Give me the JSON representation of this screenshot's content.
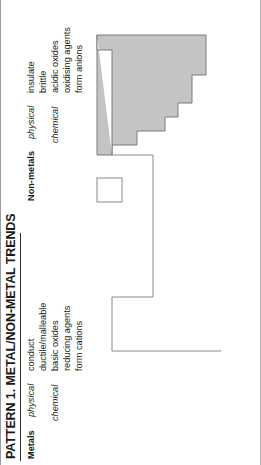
{
  "page": {
    "title": "PATTERN 1. METAL/NON-METAL TRENDS"
  },
  "legend": {
    "metals": {
      "group_label": "Metals",
      "physical_label": "physical",
      "physical_properties": [
        "conduct",
        "ductile/malleable"
      ],
      "chemical_label": "chemical",
      "chemical_properties": [
        "basic oxides",
        "reducing agents",
        "form cations"
      ]
    },
    "nonmetals": {
      "group_label": "Non-metals",
      "physical_label": "physical",
      "physical_properties": [
        "insulate",
        "brittle"
      ],
      "chemical_label": "chemical",
      "chemical_properties": [
        "acidic oxides",
        "oxidising agents",
        "form anions"
      ]
    }
  },
  "diagram": {
    "name": "periodic-table-metal-nonmetal-outline",
    "nonmetal_region_fill": "#c4c4c4",
    "nonmetal_region_stroke": "#7a7a7a",
    "metal_region_fill": "#ffffff",
    "metal_region_stroke": "#8a8a8a",
    "hydrogen_box_fill": "#ffffff",
    "hydrogen_box_stroke": "#8a8a8a"
  }
}
